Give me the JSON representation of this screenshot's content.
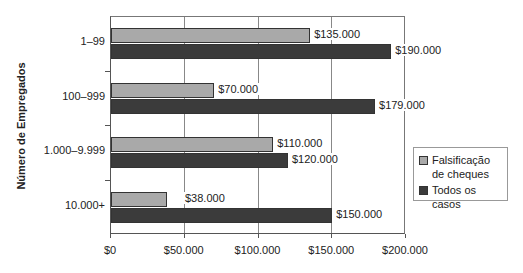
{
  "chart_data": {
    "type": "bar",
    "orientation": "horizontal",
    "title": "",
    "xlabel": "",
    "ylabel": "Número de Empregados",
    "categories": [
      "1–99",
      "100–999",
      "1.000–9.999",
      "10.000+"
    ],
    "series": [
      {
        "name": "Falsificação de cheques",
        "color": "#a9a9a9",
        "values": [
          135000,
          70000,
          110000,
          38000
        ],
        "labels": [
          "$135.000",
          "$70.000",
          "$110.000",
          "$38.000"
        ]
      },
      {
        "name": "Todos os casos",
        "color": "#3b3b3b",
        "values": [
          190000,
          179000,
          120000,
          150000
        ],
        "labels": [
          "$190.000",
          "$179.000",
          "$120.000",
          "$150.000"
        ]
      }
    ],
    "xlim": [
      0,
      200000
    ],
    "xticks": [
      "$0",
      "$50.000",
      "$100.000",
      "$150.000",
      "$200.000"
    ],
    "grid": true,
    "legend_position": "right"
  },
  "legend": {
    "item0_line1": "Falsificação",
    "item0_line2": "de cheques",
    "item1": "Todos os casos"
  }
}
